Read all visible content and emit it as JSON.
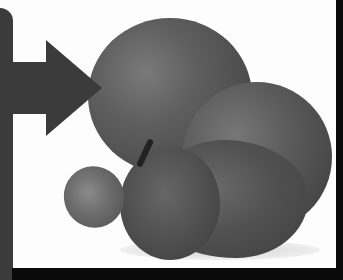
{
  "image": {
    "description": "Grayscale photo of fruit (grapefruits, plums, grape) with a dark arrow graphic at left",
    "colors": {
      "arrow": "#3b3b3b",
      "frame": "#0a0a0a",
      "background": "#fdfdfd"
    },
    "icons": [
      "arrow-right-icon"
    ]
  }
}
